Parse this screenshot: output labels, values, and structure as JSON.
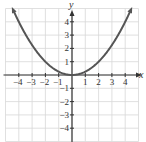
{
  "chart_data": {
    "type": "line",
    "title": "",
    "xlabel": "x",
    "ylabel": "y",
    "xlim": [
      -5,
      5
    ],
    "ylim": [
      -5,
      5
    ],
    "grid": true,
    "x_ticks": [
      -4,
      -3,
      -2,
      -1,
      1,
      2,
      3,
      4
    ],
    "y_ticks": [
      -4,
      -3,
      -2,
      -1,
      1,
      2,
      3,
      4
    ],
    "x_tick_labels": [
      "−4",
      "−3",
      "−2",
      "−1",
      "1",
      "2",
      "3",
      "4"
    ],
    "y_tick_labels": [
      "−4",
      "−3",
      "−2",
      "−1",
      "1",
      "2",
      "3",
      "4"
    ],
    "series": [
      {
        "name": "parabola",
        "equation": "y = x^2/4",
        "x": [
          -4.5,
          -4,
          -3,
          -2,
          -1,
          0,
          1,
          2,
          3,
          4,
          4.5
        ],
        "y": [
          5.06,
          4,
          2.25,
          1,
          0.25,
          0,
          0.25,
          1,
          2.25,
          4,
          5.06
        ],
        "color": "#555555",
        "arrows": "both"
      }
    ]
  },
  "colors": {
    "grid": "#d8d8d8",
    "axis": "#333333",
    "curve": "#555555"
  }
}
